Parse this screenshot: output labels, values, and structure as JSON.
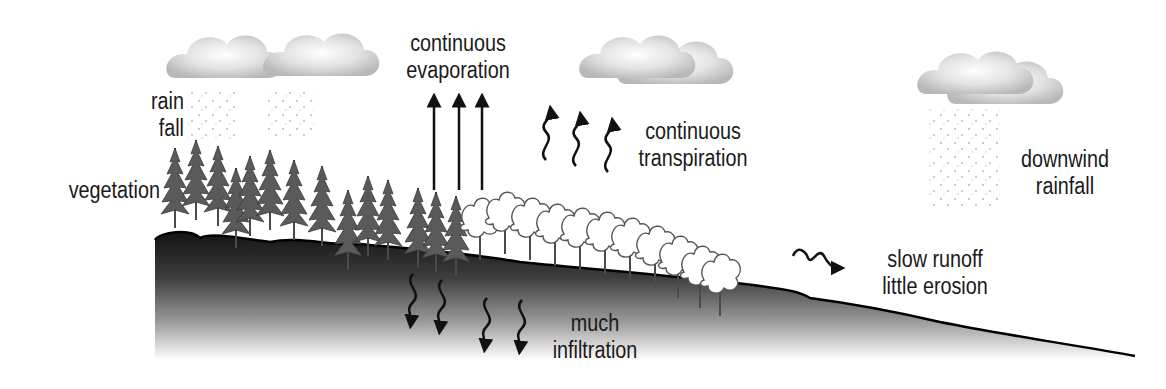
{
  "diagram": {
    "labels": {
      "rainfall": [
        "rain",
        "fall"
      ],
      "vegetation": "vegetation",
      "evaporation": [
        "continuous",
        "evaporation"
      ],
      "transpiration": [
        "continuous",
        "transpiration"
      ],
      "downwind_rainfall": [
        "downwind",
        "rainfall"
      ],
      "runoff": [
        "slow runoff",
        "little erosion"
      ],
      "infiltration": [
        "much",
        "infiltration"
      ]
    },
    "elements": {
      "clouds": 4,
      "evaporation_arrows": 3,
      "transpiration_arrows": 3,
      "infiltration_arrows": 4,
      "runoff_arrows": 1
    },
    "colors": {
      "ground_top": "#1c1c1c",
      "ground_fade": "#ffffff",
      "cloud": "#d9d9d9",
      "tree": "#555555",
      "text": "#1a1a1a"
    }
  }
}
